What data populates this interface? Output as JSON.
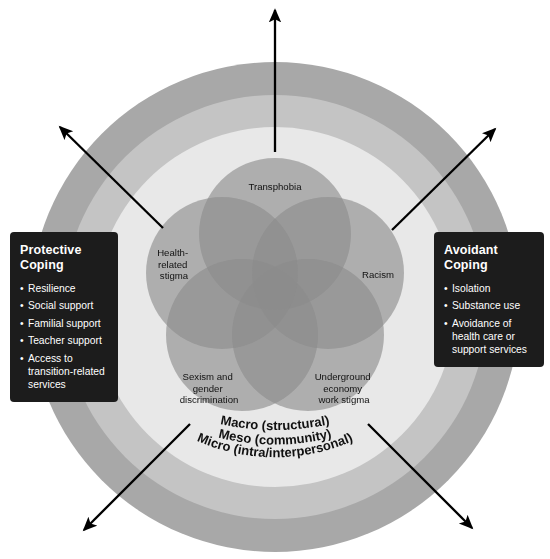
{
  "diagram": {
    "center": {
      "x": 275,
      "y": 307
    },
    "rings": [
      {
        "id": "macro",
        "label": "Macro (structural)",
        "outer_radius": 245,
        "inner_radius": 212,
        "color": "#a8a8a8"
      },
      {
        "id": "meso",
        "label": "Meso (community)",
        "outer_radius": 212,
        "inner_radius": 180,
        "color": "#c4c4c4"
      },
      {
        "id": "micro",
        "label": "Micro (intra/interpersonal)",
        "outer_radius": 180,
        "inner_radius": 0,
        "color": "#e8e8e8"
      }
    ],
    "petals": [
      {
        "id": "transphobia",
        "label": "Transphobia",
        "lines": [
          "Transphobia"
        ]
      },
      {
        "id": "racism",
        "label": "Racism",
        "lines": [
          "Racism"
        ]
      },
      {
        "id": "underground-economy",
        "label": "Underground economy work stigma",
        "lines": [
          "Underground",
          "economy",
          "work stigma"
        ]
      },
      {
        "id": "sexism",
        "label": "Sexism and gender discrimination",
        "lines": [
          "Sexism and",
          "gender",
          "discrimination"
        ]
      },
      {
        "id": "health-stigma",
        "label": "Health-related stigma",
        "lines": [
          "Health-",
          "related",
          "stigma"
        ]
      }
    ],
    "petal_color": "#9a9a9a",
    "arrows": [
      {
        "id": "arrow-top",
        "direction": "up"
      },
      {
        "id": "arrow-top-left",
        "direction": "up-left"
      },
      {
        "id": "arrow-top-right",
        "direction": "up-right"
      },
      {
        "id": "arrow-bottom-left",
        "direction": "down-left"
      },
      {
        "id": "arrow-bottom-right",
        "direction": "down-right"
      }
    ],
    "arrow_color": "#000000"
  },
  "boxes": {
    "protective": {
      "title": "Protective Coping",
      "title_lines": [
        "Protective",
        "Coping"
      ],
      "bullet": "•",
      "items": [
        "Resilience",
        "Social support",
        "Familial support",
        "Teacher support",
        "Access to transition-related services"
      ]
    },
    "avoidant": {
      "title": "Avoidant Coping",
      "title_lines": [
        "Avoidant",
        "Coping"
      ],
      "bullet": "•",
      "items": [
        "Isolation",
        "Substance use",
        "Avoidance of health care or support services"
      ]
    }
  },
  "colors": {
    "background": "#ffffff",
    "box_background": "#1c1c1c",
    "box_text": "#ffffff",
    "ring_outer": "#a8a8a8",
    "ring_middle": "#c4c4c4",
    "ring_inner": "#e8e8e8",
    "petal": "#9a9a9a",
    "label_text": "#111111"
  }
}
